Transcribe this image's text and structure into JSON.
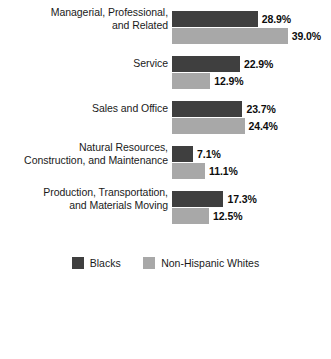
{
  "chart_data": {
    "type": "bar",
    "orientation": "horizontal",
    "title": "",
    "xlabel": "",
    "ylabel": "",
    "grid": false,
    "legend_position": "bottom",
    "xlim": [
      0,
      39.0
    ],
    "value_suffix": "%",
    "categories": [
      "Managerial, Professional, and Related",
      "Service",
      "Sales and Office",
      "Natural Resources, Construction, and Maintenance",
      "Production, Transportation, and Materials Moving"
    ],
    "category_lines": [
      [
        "Managerial, Professional,",
        "and Related"
      ],
      [
        "Service",
        ""
      ],
      [
        "Sales and Office",
        ""
      ],
      [
        "Natural Resources,",
        "Construction, and Maintenance"
      ],
      [
        "Production, Transportation,",
        "and Materials Moving"
      ]
    ],
    "series": [
      {
        "name": "Blacks",
        "color": "#3f3f3f",
        "values": [
          28.9,
          22.9,
          23.7,
          7.1,
          17.3
        ],
        "labels": [
          "28.9%",
          "22.9%",
          "23.7%",
          "7.1%",
          "17.3%"
        ]
      },
      {
        "name": "Non-Hispanic Whites",
        "color": "#a8a8a8",
        "values": [
          39.0,
          12.9,
          24.4,
          11.1,
          12.5
        ],
        "labels": [
          "39.0%",
          "12.9%",
          "24.4%",
          "11.1%",
          "12.5%"
        ]
      }
    ]
  },
  "legend": {
    "items": [
      {
        "label": "Blacks",
        "color": "#3f3f3f"
      },
      {
        "label": "Non-Hispanic Whites",
        "color": "#a8a8a8"
      }
    ]
  }
}
